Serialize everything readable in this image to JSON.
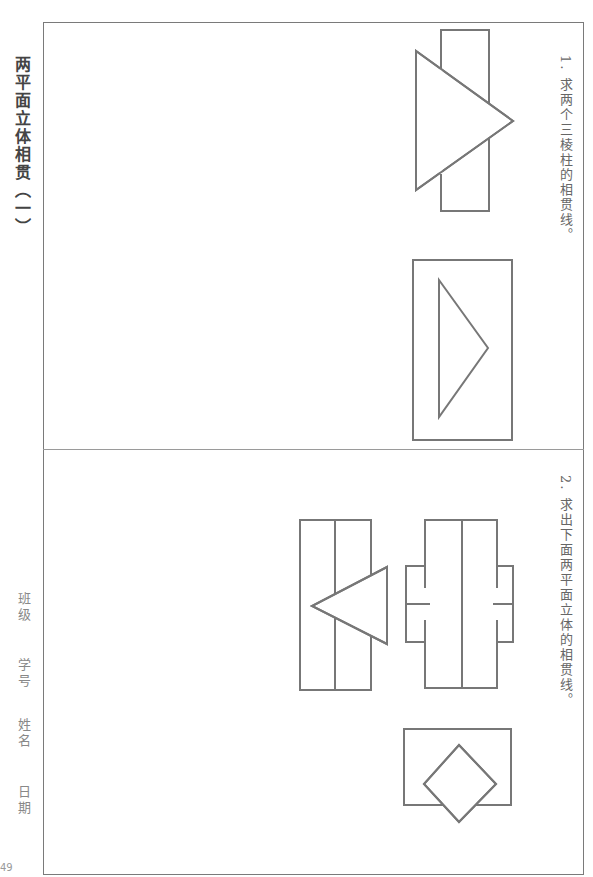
{
  "page": {
    "title": "两平面立体相贯（一）",
    "page_number": "49",
    "student_info": {
      "class_label": "班级",
      "student_id_label": "学号",
      "name_label": "姓名",
      "date_label": "日期"
    }
  },
  "questions": [
    {
      "number": "1.",
      "text": "求两个三棱柱的相贯线。",
      "figures": [
        "prism-front-view",
        "prism-top-view"
      ]
    },
    {
      "number": "2.",
      "text": "求出下面两平面立体的相贯线。",
      "figures": [
        "prism-with-triangle-view",
        "prism-with-notches-view",
        "rectangle-with-diamond-view"
      ]
    }
  ],
  "colors": {
    "line": "#777777",
    "frame": "#7a7a7a",
    "text": "#555555"
  }
}
